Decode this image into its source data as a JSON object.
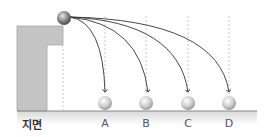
{
  "diagram": {
    "ground_label": "지면",
    "landing_labels": [
      "A",
      "B",
      "C",
      "D"
    ],
    "colors": {
      "cliff": "#c4c4c4",
      "ground_line": "#888888",
      "trajectory": "#333333",
      "dashed": "#bbbbbb",
      "ball": "#b0b0b0",
      "start_ball": "#8a8a8a"
    }
  }
}
